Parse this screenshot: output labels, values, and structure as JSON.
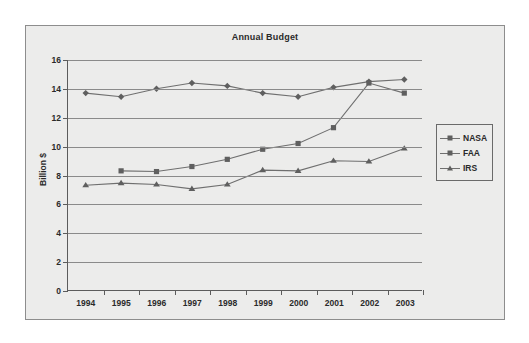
{
  "chart_data": {
    "type": "line",
    "title": "Annual Budget",
    "xlabel": "",
    "ylabel": "Billion $",
    "categories": [
      "1994",
      "1995",
      "1996",
      "1997",
      "1998",
      "1999",
      "2000",
      "2001",
      "2002",
      "2003"
    ],
    "ylim": [
      0,
      16
    ],
    "ytick_step": 2,
    "yticks": [
      "0",
      "2",
      "4",
      "6",
      "8",
      "10",
      "12",
      "14",
      "16"
    ],
    "grid": true,
    "legend_position": "right",
    "series": [
      {
        "name": "NASA",
        "marker": "diamond",
        "color": "#5f5f5f",
        "values": [
          13.7,
          13.45,
          14.0,
          14.4,
          14.2,
          13.7,
          13.45,
          14.1,
          14.5,
          14.65
        ]
      },
      {
        "name": "FAA",
        "marker": "square",
        "color": "#5f5f5f",
        "values": [
          null,
          8.3,
          8.25,
          8.6,
          9.1,
          9.8,
          10.2,
          11.3,
          14.4,
          13.7
        ]
      },
      {
        "name": "IRS",
        "marker": "triangle",
        "color": "#5f5f5f",
        "values": [
          7.3,
          7.45,
          7.35,
          7.05,
          7.35,
          8.35,
          8.3,
          9.0,
          8.95,
          9.85
        ]
      }
    ]
  },
  "legend": {
    "items": [
      {
        "label": "NASA",
        "marker": "diamond"
      },
      {
        "label": "FAA",
        "marker": "square"
      },
      {
        "label": "IRS",
        "marker": "triangle"
      }
    ]
  }
}
